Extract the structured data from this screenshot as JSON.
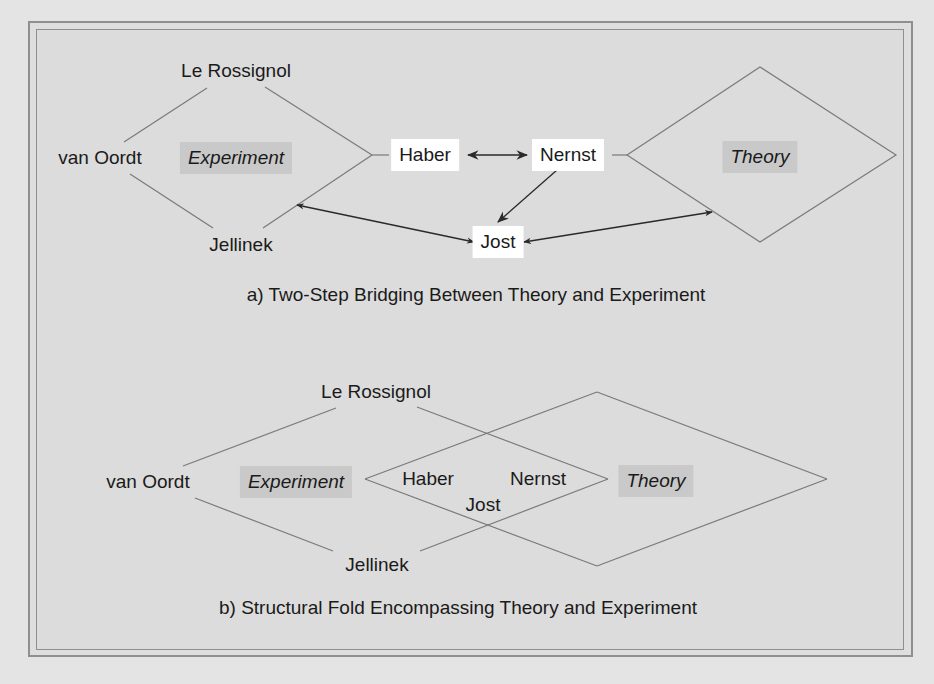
{
  "figure": {
    "panel_a": {
      "caption": "a) Two-Step Bridging Between Theory and Experiment",
      "nodes": {
        "le_rossignol": "Le Rossignol",
        "van_oordt": "van Oordt",
        "experiment": "Experiment",
        "jellinek": "Jellinek",
        "haber": "Haber",
        "nernst": "Nernst",
        "jost": "Jost",
        "theory": "Theory"
      },
      "edges": [
        {
          "from": "Haber",
          "to": "Nernst",
          "type": "bidirectional-arrow"
        },
        {
          "from": "Nernst",
          "to": "Jost",
          "type": "arrow"
        },
        {
          "from": "Jost",
          "to": "Experiment",
          "type": "bidirectional-arrow"
        },
        {
          "from": "Jost",
          "to": "Theory",
          "type": "bidirectional-arrow"
        },
        {
          "from": "Haber",
          "to": "Experiment",
          "type": "line"
        },
        {
          "from": "Nernst",
          "to": "Theory",
          "type": "line"
        }
      ]
    },
    "panel_b": {
      "caption": "b) Structural Fold Encompassing Theory and Experiment",
      "nodes": {
        "le_rossignol": "Le Rossignol",
        "van_oordt": "van Oordt",
        "experiment": "Experiment",
        "jellinek": "Jellinek",
        "haber": "Haber",
        "nernst": "Nernst",
        "jost": "Jost",
        "theory": "Theory"
      }
    },
    "colors": {
      "background": "#dcdcdc",
      "line": "#7a7a7a",
      "arrow": "#2a2a2a",
      "label_box": "#ffffff",
      "area_highlight": "#c9c9c9",
      "frame": "#8f8f8f"
    }
  }
}
